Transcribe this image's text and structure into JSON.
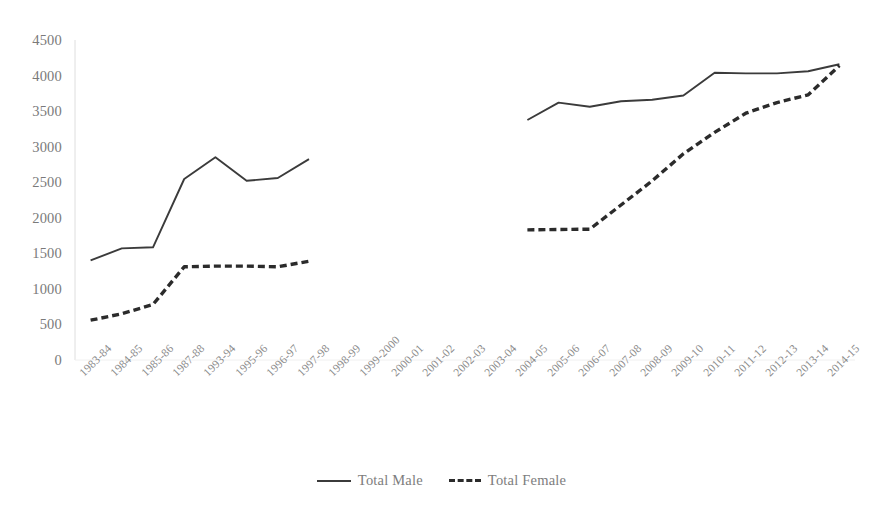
{
  "chart": {
    "title": "",
    "axis_color": "#d9d9d9",
    "series_colors": {
      "male": "#3b3b3b",
      "female": "#2b2b2b"
    }
  },
  "legend": {
    "items": [
      {
        "label": "Total Male",
        "style": "solid",
        "name": "legend-total-male"
      },
      {
        "label": "Total Female",
        "style": "dashed",
        "name": "legend-total-female"
      }
    ]
  },
  "chart_data": {
    "type": "line",
    "title": "",
    "xlabel": "",
    "ylabel": "",
    "ylim": [
      0,
      4500
    ],
    "ytick_interval": 500,
    "grid": false,
    "legend_position": "bottom",
    "yticks": [
      4500,
      4000,
      3500,
      3000,
      2500,
      2000,
      1500,
      1000,
      500,
      0
    ],
    "categories": [
      "1983-84",
      "1984-85",
      "1985-86",
      "1987-88",
      "1993-94",
      "1995-96",
      "1996-97",
      "1997-98",
      "1998-99",
      "1999-2000",
      "2000-01",
      "2001-02",
      "2002-03",
      "2003-04",
      "2004-05",
      "2005-06",
      "2006-07",
      "2007-08",
      "2008-09",
      "2009-10",
      "2010-11",
      "2011-12",
      "2012-13",
      "2013-14",
      "2014-15"
    ],
    "series": [
      {
        "name": "Total Male",
        "style": "solid",
        "values": [
          1400,
          1570,
          1585,
          2545,
          2850,
          2520,
          2560,
          2825,
          null,
          null,
          null,
          null,
          null,
          null,
          3375,
          3620,
          3560,
          3640,
          3660,
          3720,
          4040,
          4030,
          4030,
          4060,
          4160
        ]
      },
      {
        "name": "Total Female",
        "style": "dashed",
        "values": [
          560,
          650,
          780,
          1310,
          1320,
          1320,
          1310,
          1390,
          null,
          null,
          null,
          null,
          null,
          null,
          1830,
          1835,
          1840,
          2180,
          2520,
          2900,
          3200,
          3470,
          3620,
          3730,
          4140
        ]
      }
    ]
  }
}
